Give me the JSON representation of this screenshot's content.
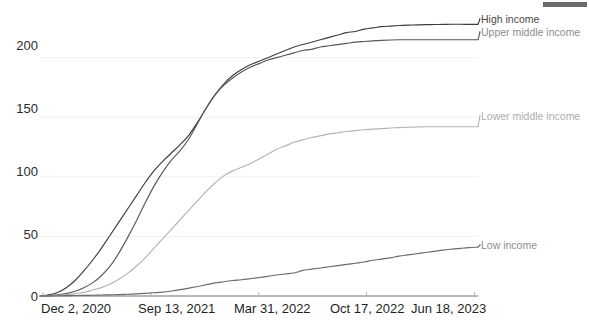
{
  "chart_data": {
    "type": "line",
    "title": "",
    "subtitle": "",
    "xlabel": "",
    "ylabel": "",
    "ylim": [
      0,
      240
    ],
    "yticks": [
      0,
      50,
      100,
      150,
      200
    ],
    "ytick_labels": [
      "0",
      "50",
      "100",
      "150",
      "200"
    ],
    "xtick_labels": [
      "Dec 2, 2020",
      "Sep 13, 2021",
      "Mar 31, 2022",
      "Oct 17, 2022",
      "Jun 18, 2023"
    ],
    "x_start": "Dec 2, 2020",
    "x_end": "Jun 18, 2023",
    "grid": true,
    "legend_position": "right-inline",
    "x": [
      0,
      0.02,
      0.04,
      0.06,
      0.08,
      0.1,
      0.12,
      0.14,
      0.16,
      0.18,
      0.2,
      0.22,
      0.24,
      0.26,
      0.28,
      0.3,
      0.32,
      0.34,
      0.36,
      0.38,
      0.4,
      0.42,
      0.44,
      0.46,
      0.48,
      0.5,
      0.52,
      0.54,
      0.56,
      0.58,
      0.6,
      0.62,
      0.64,
      0.66,
      0.68,
      0.7,
      0.72,
      0.74,
      0.76,
      0.78,
      0.8,
      0.82,
      0.84,
      0.86,
      0.88,
      0.9,
      0.92,
      0.94,
      0.96,
      0.98,
      1.0
    ],
    "series": [
      {
        "name": "High income",
        "color": "#3d3d3d",
        "final_value": 228,
        "values": [
          0,
          1,
          3,
          7,
          13,
          21,
          30,
          40,
          51,
          62,
          73,
          84,
          95,
          105,
          113,
          120,
          127,
          135,
          146,
          158,
          169,
          178,
          185,
          190,
          194,
          197,
          200,
          203,
          206,
          209,
          211,
          213,
          215,
          217,
          219,
          221,
          222,
          224,
          225,
          226,
          226.5,
          227,
          227.3,
          227.5,
          227.7,
          227.8,
          227.9,
          228,
          228,
          228,
          228
        ]
      },
      {
        "name": "Upper middle income",
        "color": "#585858",
        "final_value": 215,
        "values": [
          0,
          0.3,
          1,
          2,
          4,
          7,
          11,
          17,
          25,
          36,
          49,
          63,
          78,
          92,
          104,
          114,
          122,
          132,
          145,
          158,
          169,
          177,
          183,
          188,
          192,
          195,
          198,
          200,
          202,
          204,
          206,
          207,
          209,
          210,
          211,
          212,
          213,
          213.6,
          214.1,
          214.5,
          214.8,
          215,
          215,
          215,
          215,
          215,
          215,
          215,
          215,
          215,
          215
        ]
      },
      {
        "name": "Lower middle income",
        "color": "#b3b3b3",
        "final_value": 142,
        "values": [
          0,
          0.2,
          0.5,
          1,
          2,
          3,
          5,
          7,
          10,
          14,
          19,
          25,
          32,
          40,
          48,
          56,
          64,
          72,
          80,
          88,
          95,
          101,
          105,
          108,
          111,
          115,
          119,
          123,
          126,
          129,
          131,
          133,
          134.5,
          136,
          137,
          138,
          138.8,
          139.5,
          140,
          140.5,
          141,
          141.3,
          141.6,
          141.8,
          142,
          142,
          142,
          142,
          142,
          142,
          142
        ]
      },
      {
        "name": "Low income",
        "color": "#6a6a6a",
        "final_value": 41,
        "values": [
          0,
          0.1,
          0.2,
          0.3,
          0.4,
          0.5,
          0.6,
          0.8,
          1,
          1.2,
          1.5,
          1.8,
          2.2,
          2.7,
          3.3,
          4.2,
          5.3,
          6.6,
          8,
          9.5,
          11,
          12,
          13,
          13.6,
          14.5,
          15.5,
          16.5,
          17.6,
          18.5,
          19.3,
          21.5,
          22.5,
          23.5,
          24.5,
          25.5,
          26.5,
          27.5,
          28.5,
          30,
          31,
          32,
          33.5,
          34.5,
          35.5,
          36.5,
          37.5,
          38.5,
          39.3,
          40,
          40.6,
          41
        ]
      }
    ]
  },
  "labels": {
    "high_income": "High income",
    "upper_middle_income": "Upper middle income",
    "lower_middle_income": "Lower middle income",
    "low_income": "Low income"
  },
  "colors": {
    "high_income": "#3d3d3d",
    "upper_middle_income": "#585858",
    "lower_middle_income": "#b3b3b3",
    "low_income": "#6a6a6a",
    "axis": "#6e6e6e",
    "grid": "#f0f0f0",
    "label_text": "#8a8a8a",
    "tick_text": "#222222",
    "artifact": "#6b6b6b"
  },
  "axis": {
    "y0": "0",
    "y50": "50",
    "y100": "100",
    "y150": "150",
    "y200": "200",
    "x0": "Dec 2, 2020",
    "x1": "Sep 13, 2021",
    "x2": "Mar 31, 2022",
    "x3": "Oct 17, 2022",
    "x4": "Jun 18, 2023"
  }
}
